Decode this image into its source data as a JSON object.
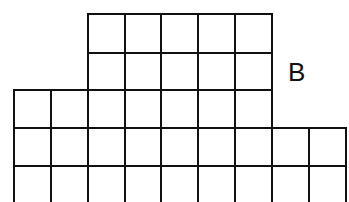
{
  "diagram": {
    "type": "grid-figure",
    "label": "B",
    "line_color": "#111111",
    "background": "#ffffff",
    "line_width": 2,
    "label_position": {
      "x": 288,
      "y": 59,
      "font_size": 26
    },
    "blocks": [
      {
        "name": "top-block",
        "x_lines": [
          88,
          125,
          161,
          198,
          235,
          272
        ],
        "y_lines": [
          14,
          53,
          90
        ]
      },
      {
        "name": "middle-row",
        "x_lines": [
          14,
          51,
          88,
          125,
          161,
          198,
          235,
          272
        ],
        "y_lines": [
          90,
          128
        ]
      },
      {
        "name": "bottom-rows",
        "x_lines": [
          14,
          51,
          88,
          125,
          161,
          198,
          235,
          272,
          309,
          346
        ],
        "y_lines": [
          128,
          166,
          204
        ]
      }
    ],
    "open_bottom": true
  }
}
